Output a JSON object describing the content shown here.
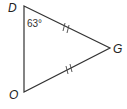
{
  "diagram": {
    "type": "triangle",
    "vertices": [
      {
        "label": "D",
        "x": 24,
        "y": 6
      },
      {
        "label": "G",
        "x": 110,
        "y": 48
      },
      {
        "label": "O",
        "x": 24,
        "y": 92
      }
    ],
    "angle_label": "63°",
    "angle_vertex": "D",
    "congruent_sides": [
      "DG",
      "OG"
    ],
    "tick_marks": "double",
    "stroke_color": "#333333"
  }
}
